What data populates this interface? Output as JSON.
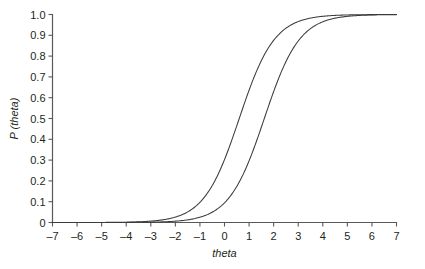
{
  "figure": {
    "background_color": "#ffffff",
    "axis_color": "#58595b",
    "curve_color": "#3b3b3d"
  },
  "chart_data": {
    "type": "line",
    "title": "",
    "subtitle": "",
    "xlabel": "theta",
    "ylabel": "P (theta)",
    "xlim": [
      -7,
      7
    ],
    "ylim": [
      0,
      1
    ],
    "grid": false,
    "legend": null,
    "legend_position": "none",
    "annotations": [],
    "xticks": [
      -7,
      -6,
      -5,
      -4,
      -3,
      -2,
      -1,
      0,
      1,
      2,
      3,
      4,
      5,
      6,
      7
    ],
    "xticklabels": [
      "–7",
      "–6",
      "–5",
      "–4",
      "–3",
      "–2",
      "–1",
      "0",
      "1",
      "2",
      "3",
      "4",
      "5",
      "6",
      "7"
    ],
    "yticks": [
      0,
      0.1,
      0.2,
      0.3,
      0.4,
      0.5,
      0.6,
      0.7,
      0.8,
      0.9,
      1.0
    ],
    "yticklabels": [
      "0",
      "0.1",
      "0.2",
      "0.3",
      "0.4",
      "0.5",
      "0.6",
      "0.7",
      "0.8",
      "0.9",
      "1.0"
    ],
    "series": [
      {
        "name": "curve-left",
        "model": "logistic",
        "a": 0.82,
        "b": 0.6,
        "x": [
          -7,
          -6.5,
          -6,
          -5.5,
          -5,
          -4.5,
          -4,
          -3.5,
          -3,
          -2.5,
          -2,
          -1.5,
          -1,
          -0.5,
          0,
          0.5,
          1,
          1.5,
          2,
          2.5,
          3,
          3.5,
          4,
          4.5,
          5,
          5.5,
          6,
          6.5,
          7
        ],
        "values": [
          0.002,
          0.003,
          0.005,
          0.007,
          0.011,
          0.016,
          0.024,
          0.036,
          0.053,
          0.078,
          0.113,
          0.16,
          0.222,
          0.299,
          0.388,
          0.484,
          0.581,
          0.671,
          0.75,
          0.814,
          0.864,
          0.902,
          0.93,
          0.95,
          0.965,
          0.976,
          0.983,
          0.989,
          0.992
        ]
      },
      {
        "name": "curve-right",
        "model": "logistic",
        "a": 0.82,
        "b": 1.62,
        "x": [
          -7,
          -6.5,
          -6,
          -5.5,
          -5,
          -4.5,
          -4,
          -3.5,
          -3,
          -2.5,
          -2,
          -1.5,
          -1,
          -0.5,
          0,
          0.5,
          1,
          1.5,
          2,
          2.5,
          3,
          3.5,
          4,
          4.5,
          5,
          5.5,
          6,
          6.5,
          7
        ],
        "values": [
          0.001,
          0.001,
          0.002,
          0.003,
          0.005,
          0.007,
          0.011,
          0.016,
          0.024,
          0.035,
          0.052,
          0.076,
          0.109,
          0.155,
          0.216,
          0.292,
          0.38,
          0.476,
          0.573,
          0.664,
          0.744,
          0.81,
          0.861,
          0.9,
          0.929,
          0.949,
          0.964,
          0.975,
          0.982
        ]
      }
    ]
  }
}
